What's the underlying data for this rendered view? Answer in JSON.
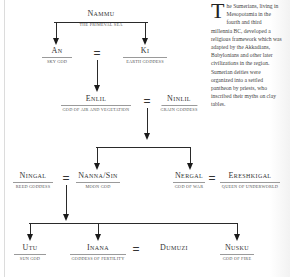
{
  "diagram": {
    "nodes": {
      "nammu": {
        "name": "Nammu",
        "title": "The Primeval Sea"
      },
      "an": {
        "name": "An",
        "title": "Sky God"
      },
      "ki": {
        "name": "Ki",
        "title": "Earth Goddess"
      },
      "enlil": {
        "name": "Enlil",
        "title": "God of Air and Vegetation"
      },
      "ninlil": {
        "name": "Ninlil",
        "title": "Grain Goddess"
      },
      "ningal": {
        "name": "Ningal",
        "title": "Reed Goddess"
      },
      "nanna": {
        "name": "Nanna/Sin",
        "title": "Moon God"
      },
      "nergal": {
        "name": "Nergal",
        "title": "God of War"
      },
      "ereshkigal": {
        "name": "Ereshkigal",
        "title": "Queen of Underworld"
      },
      "utu": {
        "name": "Utu",
        "title": "Sun God"
      },
      "inana": {
        "name": "Inana",
        "title": "Goddess of Fertility"
      },
      "dumuzi": {
        "name": "Dumuzi"
      },
      "nusku": {
        "name": "Nusku",
        "title": "God of Fire"
      }
    },
    "marriage_symbol": "=",
    "relations": [
      {
        "type": "parent",
        "from": "Nammu",
        "to": [
          "An",
          "Ki"
        ]
      },
      {
        "type": "marriage",
        "between": [
          "An",
          "Ki"
        ]
      },
      {
        "type": "parent",
        "from": "An = Ki",
        "to": [
          "Enlil"
        ]
      },
      {
        "type": "marriage",
        "between": [
          "Enlil",
          "Ninlil"
        ]
      },
      {
        "type": "parent",
        "from": "Enlil = Ninlil",
        "to": [
          "Nanna/Sin",
          "Nergal"
        ]
      },
      {
        "type": "marriage",
        "between": [
          "Ningal",
          "Nanna/Sin"
        ]
      },
      {
        "type": "marriage",
        "between": [
          "Nergal",
          "Ereshkigal"
        ]
      },
      {
        "type": "parent",
        "from": "Ningal = Nanna/Sin",
        "to": [
          "Utu",
          "Inana",
          "Nusku"
        ]
      },
      {
        "type": "marriage",
        "between": [
          "Inana",
          "Dumuzi"
        ]
      }
    ]
  },
  "sidebar_text": {
    "drop_cap": "T",
    "body": "he Sumerians, living in Mesopotamia in the fourth and third millennia BC, developed a religious framework which was adapted by the Akkadians, Babylonians and other later civilizations in the region. Sumerian deities were organized into a settled pantheon by priests, who inscribed their myths on clay tables."
  }
}
